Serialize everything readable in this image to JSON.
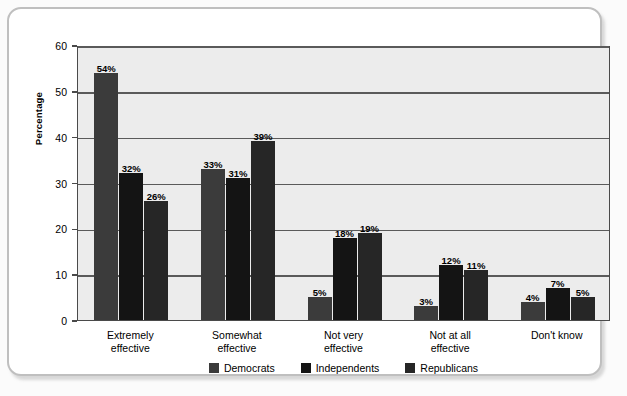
{
  "chart_data": {
    "type": "bar",
    "title": "",
    "xlabel": "",
    "ylabel": "Percentage",
    "ylim": [
      0,
      60
    ],
    "yticks": [
      0,
      10,
      20,
      30,
      40,
      50,
      60
    ],
    "ytick_labels": [
      "0",
      "10",
      "20",
      "30",
      "40",
      "50",
      "60"
    ],
    "grid": true,
    "legend_position": "bottom-center",
    "value_suffix": "%",
    "categories": [
      "Extremely effective",
      "Somewhat effective",
      "Not very effective",
      "Not at all effective",
      "Don't know"
    ],
    "category_lines": [
      [
        "Extremely",
        "effective"
      ],
      [
        "Somewhat",
        "effective"
      ],
      [
        "Not very",
        "effective"
      ],
      [
        "Not at all",
        "effective"
      ],
      [
        "Don't know",
        ""
      ]
    ],
    "series": [
      {
        "name": "Democrats",
        "color": "#3b3b3b",
        "values": [
          54,
          33,
          5,
          3,
          4
        ],
        "labels": [
          "54%",
          "33%",
          "5%",
          "3%",
          "4%"
        ]
      },
      {
        "name": "Independents",
        "color": "#141414",
        "values": [
          32,
          31,
          18,
          12,
          7
        ],
        "labels": [
          "32%",
          "31%",
          "18%",
          "12%",
          "7%"
        ]
      },
      {
        "name": "Republicans",
        "color": "#262626",
        "values": [
          26,
          39,
          19,
          11,
          5
        ],
        "labels": [
          "26%",
          "39%",
          "19%",
          "11%",
          "5%"
        ]
      }
    ]
  },
  "colors": {
    "card_background": "#ffffff",
    "card_border": "#bfbfbf",
    "plot_background": "#ececec",
    "plot_border": "#4a4a4a",
    "gridline": "#5a5a5a",
    "text": "#000000"
  }
}
